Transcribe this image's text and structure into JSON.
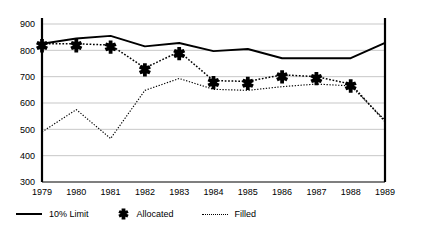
{
  "chart_data": {
    "type": "line",
    "title": "",
    "xlabel": "",
    "ylabel": "",
    "x": [
      1979,
      1980,
      1981,
      1982,
      1983,
      1984,
      1985,
      1986,
      1987,
      1988,
      1989
    ],
    "xticklabels": [
      "1979",
      "1980",
      "1981",
      "1982",
      "1983",
      "1984",
      "1985",
      "1986",
      "1987",
      "1988",
      "1989"
    ],
    "yticklabels": [
      "300",
      "400",
      "500",
      "600",
      "700",
      "800",
      "900"
    ],
    "yticks": [
      300,
      400,
      500,
      600,
      700,
      800,
      900
    ],
    "ylim": [
      300,
      900
    ],
    "xlim": [
      1979,
      1989
    ],
    "grid": "horizontal",
    "legend_position": "below-axes-left",
    "series": [
      {
        "name": "10% Limit",
        "style": "solid",
        "marker": "none",
        "color": "#000000",
        "values": [
          825,
          845,
          855,
          815,
          828,
          797,
          805,
          770,
          770,
          770,
          828
        ]
      },
      {
        "name": "Allocated",
        "style": "dotted",
        "marker": "cross",
        "color": "#000000",
        "values": [
          825,
          825,
          820,
          733,
          795,
          685,
          682,
          707,
          700,
          672,
          530
        ]
      },
      {
        "name": "Filled",
        "style": "fine-dotted",
        "marker": "none",
        "color": "#000000",
        "values": [
          490,
          575,
          465,
          648,
          693,
          652,
          648,
          662,
          672,
          665,
          535
        ]
      }
    ]
  },
  "legend": {
    "items": [
      {
        "label": "10% Limit",
        "swatch": "solid-line-swatch"
      },
      {
        "label": "Allocated",
        "swatch": "cross-marker-swatch"
      },
      {
        "label": "Filled",
        "swatch": "dotted-line-swatch"
      }
    ]
  }
}
